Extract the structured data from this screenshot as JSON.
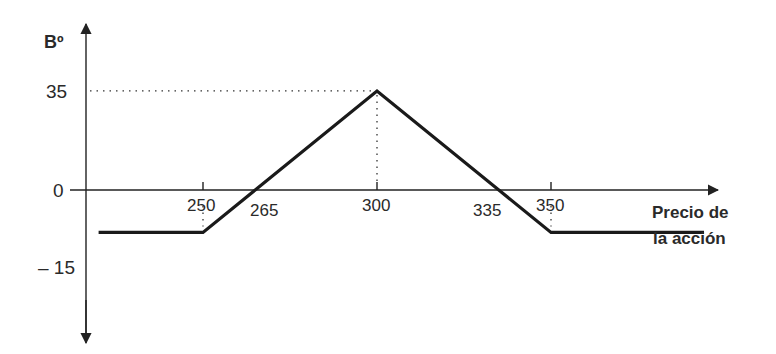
{
  "chart_data": {
    "type": "line",
    "title": "",
    "ylabel": "Bº",
    "xlabel": "Precio de la acción",
    "xlabel_lines": [
      "Precio de",
      "la acción"
    ],
    "x": [
      220,
      250,
      265,
      300,
      335,
      350,
      396
    ],
    "series": [
      {
        "name": "Beneficio",
        "values": [
          -15,
          -15,
          0,
          35,
          0,
          -15,
          -15
        ]
      }
    ],
    "x_ticks": [
      250,
      300,
      350
    ],
    "x_annotations": [
      "250",
      "265",
      "300",
      "335",
      "350"
    ],
    "y_ticks": [
      "35",
      "0",
      "– 15"
    ],
    "y_values": [
      35,
      0,
      -15
    ],
    "guides": [
      {
        "type": "horizontal-dotted",
        "y": 35,
        "from_x": "axis",
        "to_x": 300
      },
      {
        "type": "vertical-dotted",
        "x": 300,
        "from_y": 35,
        "to_y": 0
      },
      {
        "type": "vertical-dotted",
        "x": 250,
        "from_y": 0,
        "to_y": -15
      },
      {
        "type": "vertical-dotted",
        "x": 350,
        "from_y": 0,
        "to_y": -15
      }
    ],
    "grid": false,
    "legend": null
  },
  "labels": {
    "y_axis": "Bº",
    "y35": "35",
    "y0": "0",
    "ym15": "– 15",
    "x250": "250",
    "x265": "265",
    "x300": "300",
    "x335": "335",
    "x350": "350",
    "xlabel_line1": "Precio de",
    "xlabel_line2": "la acción"
  },
  "colors": {
    "line": "#1a1a1a",
    "axis": "#222222",
    "text": "#2a2a2a"
  }
}
